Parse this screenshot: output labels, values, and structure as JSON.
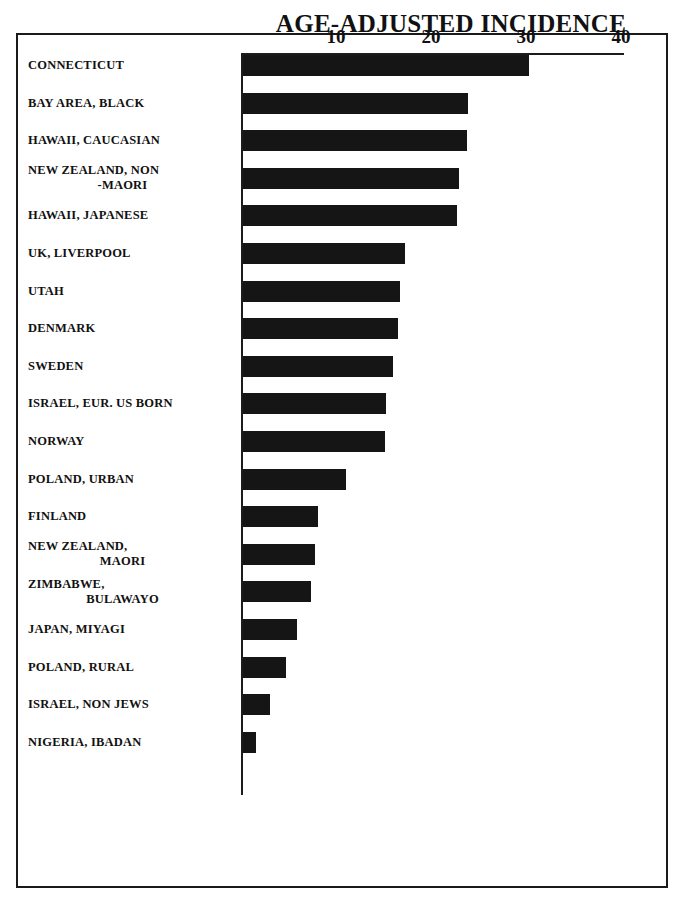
{
  "chart_data": {
    "type": "bar",
    "orientation": "horizontal",
    "title": "AGE-ADJUSTED INCIDENCE",
    "xlabel": "",
    "ylabel": "",
    "xlim": [
      0,
      42
    ],
    "grid": false,
    "legend": null,
    "tick_labels": [
      "10",
      "20",
      "30",
      "40"
    ],
    "ticks": [
      10,
      20,
      30,
      40
    ],
    "bar_color": "#151515",
    "categories": [
      "CONNECTICUT",
      "BAY AREA, BLACK",
      "HAWAII, CAUCASIAN",
      "NEW ZEALAND, NON -MAORI",
      "HAWAII, JAPANESE",
      "UK, LIVERPOOL",
      "UTAH",
      "DENMARK",
      "SWEDEN",
      "ISRAEL, EUR. US BORN",
      "NORWAY",
      "POLAND, URBAN",
      "FINLAND",
      "NEW ZEALAND, MAORI",
      "ZIMBABWE, BULAWAYO",
      "JAPAN, MIYAGI",
      "POLAND, RURAL",
      "ISRAEL, NON JEWS",
      "NIGERIA, IBADAN"
    ],
    "category_lines": [
      [
        "CONNECTICUT"
      ],
      [
        "BAY AREA, BLACK"
      ],
      [
        "HAWAII, CAUCASIAN"
      ],
      [
        "NEW ZEALAND, NON",
        "-MAORI"
      ],
      [
        "HAWAII, JAPANESE"
      ],
      [
        "UK, LIVERPOOL"
      ],
      [
        "UTAH"
      ],
      [
        "DENMARK"
      ],
      [
        "SWEDEN"
      ],
      [
        "ISRAEL, EUR. US BORN"
      ],
      [
        "NORWAY"
      ],
      [
        "POLAND, URBAN"
      ],
      [
        "FINLAND"
      ],
      [
        "NEW ZEALAND,",
        "MAORI"
      ],
      [
        "ZIMBABWE,",
        "BULAWAYO"
      ],
      [
        "JAPAN, MIYAGI"
      ],
      [
        "POLAND, RURAL"
      ],
      [
        "ISRAEL, NON JEWS"
      ],
      [
        "NIGERIA, IBADAN"
      ]
    ],
    "values": [
      30.1,
      23.7,
      23.6,
      22.7,
      22.5,
      17.0,
      16.5,
      16.3,
      15.8,
      15.1,
      14.9,
      10.8,
      7.9,
      7.6,
      7.2,
      5.7,
      4.5,
      2.8,
      1.4
    ]
  }
}
